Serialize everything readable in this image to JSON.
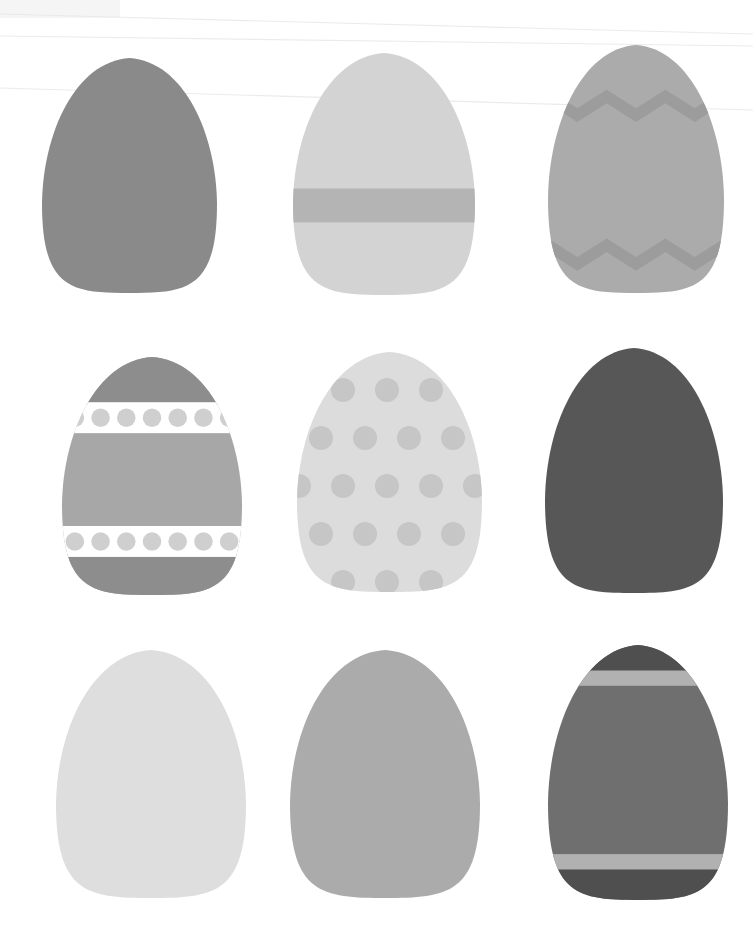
{
  "canvas": {
    "width": 753,
    "height": 942,
    "background": "#ffffff",
    "title": "Easter egg collection grayscale illustration"
  },
  "scan": {
    "line_color": "#e8e8e8",
    "lines": [
      {
        "name": "scan-line-top",
        "x1": 0,
        "y1": 14,
        "x2": 753,
        "y2": 34
      },
      {
        "name": "scan-line-upper",
        "x1": 0,
        "y1": 36,
        "x2": 753,
        "y2": 46
      },
      {
        "name": "scan-line-mid",
        "x1": 0,
        "y1": 88,
        "x2": 753,
        "y2": 110
      }
    ],
    "corner_smudge": {
      "name": "corner-smudge",
      "x": 0,
      "y": 0,
      "width": 120,
      "height": 18,
      "color": "#f4f4f4"
    }
  },
  "grid": {
    "columns": 3,
    "rows": 3,
    "count": 9
  },
  "eggs": [
    {
      "id": "egg-1",
      "name": "plain-dark-gray-egg",
      "row": 1,
      "column": 1,
      "pattern": "solid",
      "label": "Solid medium-dark gray egg",
      "x": 42,
      "y": 58,
      "width": 175,
      "height": 235,
      "base_color": "#8a8a8a",
      "accent_color": "#8a8a8a",
      "bands": [],
      "dots": false,
      "zigzag": false
    },
    {
      "id": "egg-2",
      "name": "banded-light-gray-egg",
      "row": 1,
      "column": 2,
      "pattern": "single-band",
      "label": "Light gray egg with single wide horizontal band",
      "x": 293,
      "y": 53,
      "width": 182,
      "height": 242,
      "base_color": "#d3d3d3",
      "accent_color": "#b4b4b4",
      "bands": [
        {
          "name": "band-middle",
          "top_pct": 56,
          "height_pct": 14,
          "color": "#b4b4b4"
        }
      ],
      "dots": false,
      "zigzag": false
    },
    {
      "id": "egg-3",
      "name": "zigzag-gray-egg",
      "row": 1,
      "column": 3,
      "pattern": "zigzag",
      "label": "Gray egg with zigzag chevron bands top and bottom",
      "x": 548,
      "y": 45,
      "width": 176,
      "height": 248,
      "base_color": "#ababab",
      "accent_color": "#9c9c9c",
      "bands": [],
      "dots": false,
      "zigzag": true,
      "zigzag_top_pct": 18,
      "zigzag_bottom_pct": 78,
      "zigzag_teeth": 6
    },
    {
      "id": "egg-4",
      "name": "dotted-band-gray-egg",
      "row": 2,
      "column": 1,
      "pattern": "dotted-bands",
      "label": "Gray egg with two white bands of gray polka dots",
      "x": 62,
      "y": 357,
      "width": 180,
      "height": 238,
      "base_color": "#a7a7a7",
      "accent_color": "#8d8d8d",
      "cap_color": "#8d8d8d",
      "band_color": "#ffffff",
      "dot_color": "#cfcfcf",
      "bands": [
        {
          "name": "band-upper-white",
          "top_pct": 19,
          "height_pct": 13,
          "color": "#ffffff"
        },
        {
          "name": "band-lower-white",
          "top_pct": 71,
          "height_pct": 13,
          "color": "#ffffff"
        }
      ],
      "dots": true,
      "dot_count_per_band": 7,
      "zigzag": false
    },
    {
      "id": "egg-5",
      "name": "polka-dot-light-egg",
      "row": 2,
      "column": 2,
      "pattern": "polka-dots",
      "label": "Very light gray egg covered in soft gray polka dots",
      "x": 297,
      "y": 352,
      "width": 185,
      "height": 240,
      "base_color": "#dcdcdc",
      "accent_color": "#c6c6c6",
      "dots": true,
      "dot_color": "#c6c6c6",
      "dot_radius": 12,
      "dot_spacing_x": 44,
      "dot_spacing_y": 48,
      "bands": [],
      "zigzag": false
    },
    {
      "id": "egg-6",
      "name": "plain-charcoal-egg",
      "row": 2,
      "column": 3,
      "pattern": "solid",
      "label": "Solid charcoal dark gray egg",
      "x": 545,
      "y": 348,
      "width": 178,
      "height": 245,
      "base_color": "#575757",
      "accent_color": "#575757",
      "bands": [],
      "dots": false,
      "zigzag": false
    },
    {
      "id": "egg-7",
      "name": "plain-pale-egg",
      "row": 3,
      "column": 1,
      "pattern": "solid",
      "label": "Solid pale light gray egg",
      "x": 56,
      "y": 650,
      "width": 190,
      "height": 248,
      "base_color": "#dedede",
      "accent_color": "#dedede",
      "bands": [],
      "dots": false,
      "zigzag": false
    },
    {
      "id": "egg-8",
      "name": "plain-mid-gray-egg",
      "row": 3,
      "column": 2,
      "pattern": "solid",
      "label": "Solid mid gray egg",
      "x": 290,
      "y": 650,
      "width": 190,
      "height": 248,
      "base_color": "#ababab",
      "accent_color": "#ababab",
      "bands": [],
      "dots": false,
      "zigzag": false
    },
    {
      "id": "egg-9",
      "name": "striped-dark-egg",
      "row": 3,
      "column": 3,
      "pattern": "two-bands",
      "label": "Dark gray egg with light bands near top and bottom",
      "x": 548,
      "y": 645,
      "width": 180,
      "height": 255,
      "base_color": "#6f6f6f",
      "cap_color": "#4f4f4f",
      "accent_color": "#b1b1b1",
      "bands": [
        {
          "name": "band-top-light",
          "top_pct": 10,
          "height_pct": 6,
          "color": "#b1b1b1"
        },
        {
          "name": "band-bottom-light",
          "top_pct": 82,
          "height_pct": 6,
          "color": "#b1b1b1"
        }
      ],
      "dots": false,
      "zigzag": false
    }
  ]
}
